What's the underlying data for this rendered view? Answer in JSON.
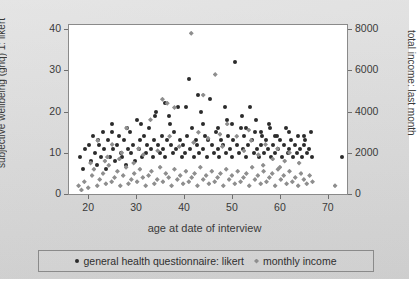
{
  "chart_data": {
    "type": "scatter",
    "title": "",
    "xlabel": "age at date of interview",
    "ylabel": "subjective wellbeing (ghq) 1: likert",
    "ylabel_right": "total income: last month",
    "xlim": [
      16,
      74
    ],
    "ylim": [
      0,
      41
    ],
    "ylim_right": [
      0,
      8200
    ],
    "grid": false,
    "legend_position": "bottom",
    "xticks": [
      20,
      30,
      40,
      50,
      60,
      70
    ],
    "yticks": [
      0,
      10,
      20,
      30,
      40
    ],
    "yticks_right": [
      0,
      2000,
      4000,
      6000,
      8000
    ],
    "series": [
      {
        "name": "general health questionnaire: likert",
        "marker": "circle",
        "color": "#2b2b2b",
        "axis": "left",
        "points": [
          [
            18.2,
            9.0
          ],
          [
            19.0,
            6.0
          ],
          [
            19.4,
            11.0
          ],
          [
            20.1,
            12.0
          ],
          [
            20.6,
            8.0
          ],
          [
            21.0,
            14.0
          ],
          [
            21.4,
            10.0
          ],
          [
            21.8,
            7.0
          ],
          [
            22.2,
            12.0
          ],
          [
            22.6,
            9.0
          ],
          [
            23.0,
            15.0
          ],
          [
            23.3,
            11.0
          ],
          [
            23.8,
            6.0
          ],
          [
            24.1,
            13.0
          ],
          [
            24.5,
            9.0
          ],
          [
            24.9,
            17.0
          ],
          [
            25.2,
            11.0
          ],
          [
            25.6,
            8.0
          ],
          [
            26.0,
            12.0
          ],
          [
            26.4,
            14.0
          ],
          [
            26.8,
            10.0
          ],
          [
            27.1,
            9.0
          ],
          [
            27.5,
            13.0
          ],
          [
            27.9,
            7.0
          ],
          [
            28.3,
            11.0
          ],
          [
            28.7,
            15.0
          ],
          [
            29.0,
            10.0
          ],
          [
            29.4,
            12.0
          ],
          [
            29.8,
            8.0
          ],
          [
            30.1,
            18.0
          ],
          [
            30.5,
            11.0
          ],
          [
            30.9,
            13.0
          ],
          [
            31.2,
            9.0
          ],
          [
            31.6,
            14.0
          ],
          [
            32.0,
            10.0
          ],
          [
            32.3,
            12.0
          ],
          [
            32.7,
            16.0
          ],
          [
            33.1,
            11.0
          ],
          [
            33.5,
            9.0
          ],
          [
            33.8,
            13.0
          ],
          [
            34.2,
            20.0
          ],
          [
            34.6,
            12.0
          ],
          [
            35.0,
            10.0
          ],
          [
            35.3,
            14.0
          ],
          [
            35.7,
            11.0
          ],
          [
            36.1,
            9.0
          ],
          [
            36.5,
            13.0
          ],
          [
            36.8,
            19.0
          ],
          [
            37.2,
            12.0
          ],
          [
            37.6,
            10.0
          ],
          [
            38.0,
            15.0
          ],
          [
            38.3,
            11.0
          ],
          [
            38.7,
            21.0
          ],
          [
            39.1,
            13.0
          ],
          [
            39.5,
            9.0
          ],
          [
            39.8,
            12.0
          ],
          [
            40.2,
            10.0
          ],
          [
            40.6,
            14.0
          ],
          [
            41.0,
            28.0
          ],
          [
            41.3,
            11.0
          ],
          [
            41.7,
            16.0
          ],
          [
            42.1,
            9.0
          ],
          [
            42.5,
            13.0
          ],
          [
            42.8,
            12.0
          ],
          [
            43.2,
            10.0
          ],
          [
            43.6,
            20.0
          ],
          [
            44.0,
            11.0
          ],
          [
            44.3,
            14.0
          ],
          [
            44.7,
            9.0
          ],
          [
            45.1,
            13.0
          ],
          [
            45.5,
            23.0
          ],
          [
            45.8,
            12.0
          ],
          [
            46.2,
            10.0
          ],
          [
            46.6,
            15.0
          ],
          [
            47.0,
            11.0
          ],
          [
            47.3,
            9.0
          ],
          [
            47.7,
            13.0
          ],
          [
            48.1,
            12.0
          ],
          [
            48.5,
            21.0
          ],
          [
            48.8,
            10.0
          ],
          [
            49.2,
            14.0
          ],
          [
            49.6,
            11.0
          ],
          [
            50.0,
            9.0
          ],
          [
            50.3,
            13.0
          ],
          [
            50.7,
            32.0
          ],
          [
            51.1,
            12.0
          ],
          [
            51.5,
            10.0
          ],
          [
            51.8,
            16.0
          ],
          [
            52.2,
            11.0
          ],
          [
            52.6,
            14.0
          ],
          [
            53.0,
            9.0
          ],
          [
            53.3,
            12.0
          ],
          [
            53.7,
            21.0
          ],
          [
            54.1,
            13.0
          ],
          [
            54.5,
            10.0
          ],
          [
            54.8,
            15.0
          ],
          [
            55.2,
            11.0
          ],
          [
            55.6,
            9.0
          ],
          [
            56.0,
            12.0
          ],
          [
            56.3,
            14.0
          ],
          [
            56.7,
            10.0
          ],
          [
            57.1,
            13.0
          ],
          [
            57.5,
            11.0
          ],
          [
            57.8,
            17.0
          ],
          [
            58.2,
            9.0
          ],
          [
            58.6,
            12.0
          ],
          [
            59.0,
            10.0
          ],
          [
            59.3,
            14.0
          ],
          [
            59.7,
            11.0
          ],
          [
            60.1,
            13.0
          ],
          [
            60.5,
            9.0
          ],
          [
            60.8,
            12.0
          ],
          [
            61.2,
            16.0
          ],
          [
            61.6,
            10.0
          ],
          [
            62.0,
            11.0
          ],
          [
            62.3,
            13.0
          ],
          [
            62.7,
            9.0
          ],
          [
            63.1,
            12.0
          ],
          [
            63.5,
            10.0
          ],
          [
            63.8,
            14.0
          ],
          [
            64.2,
            11.0
          ],
          [
            64.6,
            9.0
          ],
          [
            65.0,
            12.0
          ],
          [
            65.3,
            13.0
          ],
          [
            65.7,
            10.0
          ],
          [
            66.1,
            11.0
          ],
          [
            66.5,
            15.0
          ],
          [
            66.8,
            9.0
          ],
          [
            73.0,
            9.0
          ],
          [
            36.0,
            22.0
          ],
          [
            40.4,
            21.0
          ],
          [
            43.0,
            24.0
          ],
          [
            49.0,
            18.0
          ],
          [
            52.0,
            19.0
          ],
          [
            55.0,
            18.0
          ],
          [
            58.0,
            16.0
          ],
          [
            34.0,
            19.0
          ],
          [
            31.0,
            17.0
          ],
          [
            28.0,
            16.0
          ],
          [
            25.0,
            15.0
          ],
          [
            22.0,
            13.0
          ],
          [
            37.0,
            17.0
          ],
          [
            44.0,
            17.0
          ],
          [
            47.0,
            16.0
          ],
          [
            50.0,
            17.0
          ],
          [
            53.0,
            16.0
          ],
          [
            56.0,
            15.0
          ],
          [
            59.0,
            14.0
          ],
          [
            62.0,
            15.0
          ],
          [
            65.0,
            14.0
          ]
        ]
      },
      {
        "name": "monthly income",
        "marker": "diamond",
        "color": "#8e8e8e",
        "axis": "right",
        "points": [
          [
            18.0,
            400
          ],
          [
            18.6,
            200
          ],
          [
            19.2,
            600
          ],
          [
            20.0,
            300
          ],
          [
            20.8,
            900
          ],
          [
            21.2,
            1200
          ],
          [
            21.9,
            400
          ],
          [
            22.4,
            700
          ],
          [
            23.1,
            1000
          ],
          [
            23.7,
            500
          ],
          [
            24.3,
            1400
          ],
          [
            24.9,
            600
          ],
          [
            25.5,
            800
          ],
          [
            26.1,
            1100
          ],
          [
            26.7,
            400
          ],
          [
            27.3,
            900
          ],
          [
            27.9,
            1300
          ],
          [
            28.4,
            500
          ],
          [
            29.0,
            700
          ],
          [
            29.6,
            1000
          ],
          [
            30.2,
            600
          ],
          [
            30.8,
            1200
          ],
          [
            31.4,
            800
          ],
          [
            32.0,
            400
          ],
          [
            32.6,
            900
          ],
          [
            33.2,
            1100
          ],
          [
            33.8,
            500
          ],
          [
            34.4,
            700
          ],
          [
            35.0,
            1300
          ],
          [
            35.6,
            600
          ],
          [
            36.2,
            1000
          ],
          [
            36.8,
            800
          ],
          [
            37.4,
            400
          ],
          [
            38.0,
            1200
          ],
          [
            38.6,
            700
          ],
          [
            39.2,
            900
          ],
          [
            39.8,
            500
          ],
          [
            40.4,
            1100
          ],
          [
            41.0,
            600
          ],
          [
            41.6,
            800
          ],
          [
            42.2,
            1000
          ],
          [
            42.8,
            400
          ],
          [
            43.4,
            1300
          ],
          [
            44.0,
            700
          ],
          [
            44.6,
            900
          ],
          [
            45.2,
            500
          ],
          [
            45.8,
            1100
          ],
          [
            46.4,
            600
          ],
          [
            47.0,
            800
          ],
          [
            47.6,
            1000
          ],
          [
            48.2,
            400
          ],
          [
            48.8,
            1200
          ],
          [
            49.4,
            700
          ],
          [
            50.0,
            900
          ],
          [
            50.6,
            500
          ],
          [
            51.2,
            1100
          ],
          [
            51.8,
            600
          ],
          [
            52.4,
            800
          ],
          [
            53.0,
            1000
          ],
          [
            53.6,
            400
          ],
          [
            54.2,
            1300
          ],
          [
            54.8,
            700
          ],
          [
            55.4,
            900
          ],
          [
            56.0,
            500
          ],
          [
            56.6,
            1100
          ],
          [
            57.2,
            600
          ],
          [
            57.8,
            800
          ],
          [
            58.4,
            1000
          ],
          [
            59.0,
            400
          ],
          [
            59.6,
            1200
          ],
          [
            60.2,
            700
          ],
          [
            60.8,
            900
          ],
          [
            61.4,
            500
          ],
          [
            62.0,
            1100
          ],
          [
            62.6,
            600
          ],
          [
            63.2,
            800
          ],
          [
            63.8,
            400
          ],
          [
            64.4,
            1000
          ],
          [
            65.0,
            700
          ],
          [
            65.6,
            500
          ],
          [
            66.2,
            900
          ],
          [
            66.8,
            600
          ],
          [
            71.5,
            400
          ],
          [
            22.0,
            2600
          ],
          [
            25.0,
            2400
          ],
          [
            28.0,
            3200
          ],
          [
            30.5,
            2200
          ],
          [
            33.0,
            3600
          ],
          [
            35.5,
            4600
          ],
          [
            36.5,
            4400
          ],
          [
            38.0,
            4200
          ],
          [
            41.5,
            7800
          ],
          [
            44.0,
            4800
          ],
          [
            46.5,
            5800
          ],
          [
            49.0,
            3400
          ],
          [
            51.0,
            2800
          ],
          [
            54.0,
            2600
          ],
          [
            57.0,
            2400
          ],
          [
            59.5,
            2200
          ],
          [
            62.0,
            2000
          ],
          [
            24.0,
            1800
          ],
          [
            27.0,
            2000
          ],
          [
            31.5,
            1900
          ],
          [
            34.5,
            2100
          ],
          [
            39.0,
            2300
          ],
          [
            42.0,
            2500
          ],
          [
            45.0,
            2700
          ],
          [
            48.0,
            2300
          ],
          [
            52.5,
            2100
          ],
          [
            55.5,
            1900
          ],
          [
            58.5,
            1700
          ],
          [
            61.0,
            1600
          ],
          [
            64.0,
            1500
          ],
          [
            20.5,
            1500
          ],
          [
            23.5,
            1600
          ],
          [
            26.5,
            1700
          ],
          [
            29.5,
            1500
          ],
          [
            37.0,
            2800
          ],
          [
            43.0,
            3000
          ],
          [
            47.5,
            2900
          ],
          [
            53.5,
            3100
          ],
          [
            56.5,
            1400
          ],
          [
            60.0,
            1300
          ]
        ]
      }
    ]
  },
  "legend": {
    "items": [
      {
        "label": "general health questionnaire: likert",
        "marker": "ghq"
      },
      {
        "label": "monthly income",
        "marker": "inc"
      }
    ]
  }
}
